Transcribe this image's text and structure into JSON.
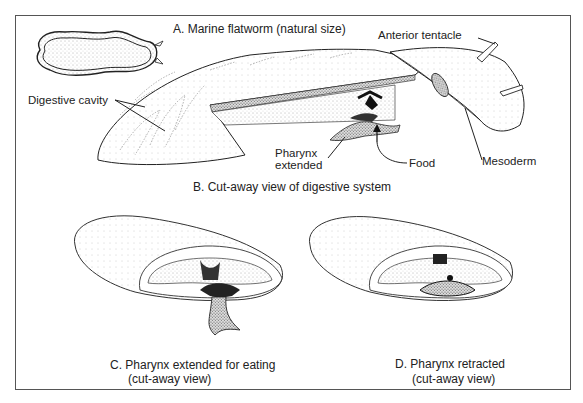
{
  "figure": {
    "panels": [
      {
        "id": "A",
        "caption": "A.  Marine flatworm (natural size)"
      },
      {
        "id": "B",
        "caption": "B.  Cut-away view of digestive system"
      },
      {
        "id": "C",
        "caption_line1": "C.  Pharynx extended for eating",
        "caption_line2": "(cut-away view)"
      },
      {
        "id": "D",
        "caption_line1": "D.  Pharynx retracted",
        "caption_line2": "(cut-away view)"
      }
    ],
    "labels": {
      "digestive_cavity": "Digestive cavity",
      "anterior_tentacle": "Anterior tentacle",
      "pharynx_line1": "Pharynx",
      "pharynx_line2": "extended",
      "food": "Food",
      "mesoderm": "Mesoderm"
    }
  }
}
